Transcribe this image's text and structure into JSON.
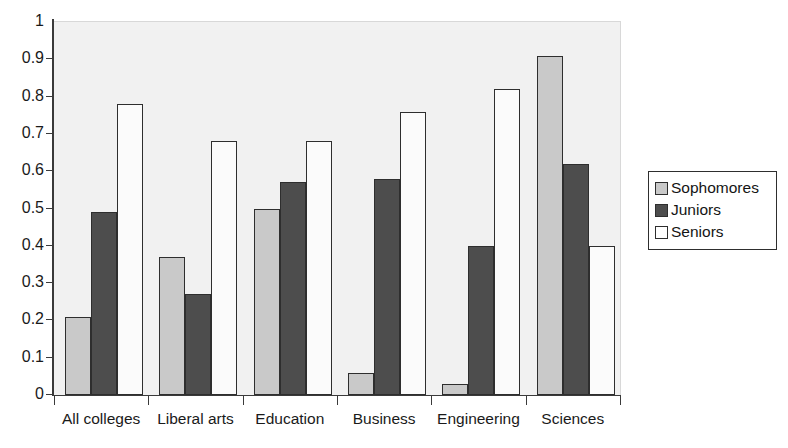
{
  "chart_data": {
    "type": "bar",
    "title": "",
    "subtitle": "",
    "xlabel": "",
    "ylabel": "",
    "ylim": [
      0,
      1
    ],
    "grid": false,
    "legend_position": "right",
    "categories": [
      "All colleges",
      "Liberal arts",
      "Education",
      "Business",
      "Engineering",
      "Sciences"
    ],
    "y_ticks": [
      "1",
      "0.9",
      "0.8",
      "0.7",
      "0.6",
      "0.5",
      "0.4",
      "0.3",
      "0.2",
      "0.1",
      "0"
    ],
    "y_tick_values": [
      1,
      0.9,
      0.8,
      0.7,
      0.6,
      0.5,
      0.4,
      0.3,
      0.2,
      0.1,
      0
    ],
    "series": [
      {
        "name": "Sophomores",
        "color": "#c9c9c9",
        "values": [
          0.21,
          0.37,
          0.5,
          0.06,
          0.03,
          0.91
        ]
      },
      {
        "name": "Juniors",
        "color": "#4d4d4d",
        "values": [
          0.49,
          0.27,
          0.57,
          0.58,
          0.4,
          0.62
        ]
      },
      {
        "name": "Seniors",
        "color": "#ffffff",
        "values": [
          0.78,
          0.68,
          0.68,
          0.76,
          0.82,
          0.4
        ]
      }
    ],
    "colors": {
      "plot_background": "#f1f1f1",
      "axis": "#3a3a3a",
      "bar_outline": "#2e2e2e",
      "page_background": "#ffffff"
    }
  },
  "legend": {
    "entries": [
      {
        "label": "Sophomores"
      },
      {
        "label": "Juniors"
      },
      {
        "label": "Seniors"
      }
    ]
  }
}
